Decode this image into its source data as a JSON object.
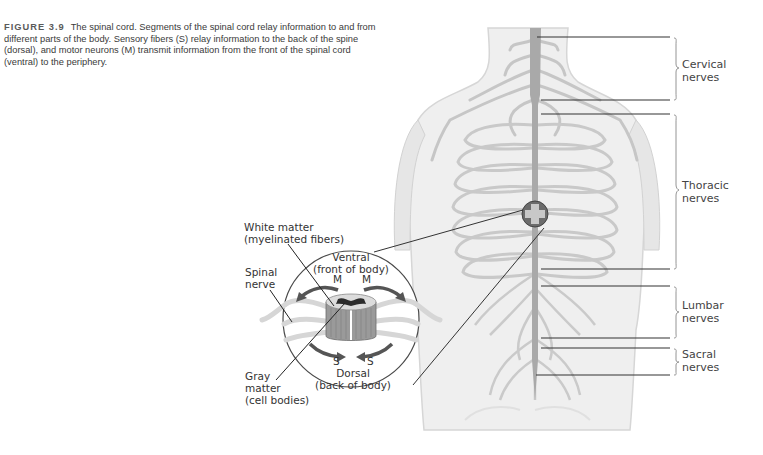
{
  "caption": {
    "figure_label": "FIGURE 3.9",
    "text": "The spinal cord. Segments of the spinal cord relay information to and from different parts of the body. Sensory fibers (S) relay information to the back of the spine (dorsal), and motor neurons (M) transmit information from the front of the spinal cord (ventral) to the periphery."
  },
  "nerve_regions": [
    {
      "line1": "Cervical",
      "line2": "nerves"
    },
    {
      "line1": "Thoracic",
      "line2": "nerves"
    },
    {
      "line1": "Lumbar",
      "line2": "nerves"
    },
    {
      "line1": "Sacral",
      "line2": "nerves"
    }
  ],
  "inset": {
    "white_matter": {
      "line1": "White matter",
      "line2": "(myelinated fibers)"
    },
    "spinal_nerve": {
      "line1": "Spinal",
      "line2": "nerve"
    },
    "ventral": {
      "line1": "Ventral",
      "line2": "(front of body)"
    },
    "motor_left": "M",
    "motor_right": "M",
    "sensory_left": "S",
    "sensory_right": "S",
    "dorsal": {
      "line1": "Dorsal",
      "line2": "(back of body)"
    },
    "gray_matter": {
      "line1": "Gray",
      "line2": "matter",
      "line3": "(cell bodies)"
    }
  },
  "colors": {
    "body_fill": "#ececec",
    "body_outline": "#cfcfcf",
    "nerve": "#c4c4c4",
    "cord": "#a8a8a8",
    "leader": "#2a2a2a"
  }
}
